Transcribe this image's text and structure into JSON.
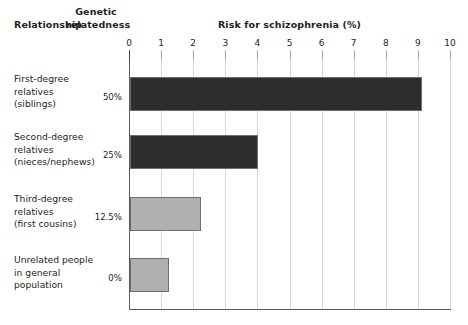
{
  "header": {
    "relationship": "Relationship",
    "genetic_relatedness": "Genetic relatedness",
    "genetic_line1": "Genetic",
    "genetic_line2": "relatedness",
    "risk_title": "Risk for schizophrenia (%)"
  },
  "colors": {
    "bar_dark": "#2d2d2d",
    "bar_light": "#b0b0b0",
    "bar_border": "#6d6e71",
    "gridline": "#d9d9d9",
    "axis": "#58595b",
    "text": "#231f20",
    "background": "#ffffff"
  },
  "chart_data": {
    "type": "bar",
    "orientation": "horizontal",
    "title": "Risk for schizophrenia (%)",
    "xlabel": "Risk for schizophrenia (%)",
    "ylabel": "Relationship",
    "xlim": [
      0,
      10
    ],
    "xticks": [
      0,
      1,
      2,
      3,
      4,
      5,
      6,
      7,
      8,
      9,
      10
    ],
    "xtick_labels": [
      "0",
      "1",
      "2",
      "3",
      "4",
      "5",
      "6",
      "7",
      "8",
      "9",
      "10"
    ],
    "grid": true,
    "legend": false,
    "categories": [
      "First-degree relatives (siblings)",
      "Second-degree relatives (nieces/nephews)",
      "Third-degree relatives (first cousins)",
      "Unrelated people in general population"
    ],
    "values": [
      9.1,
      4.0,
      2.2,
      1.2
    ],
    "genetic_relatedness": [
      "50%",
      "25%",
      "12.5%",
      "0%"
    ]
  },
  "rows": [
    {
      "label_lines": [
        "First-degree",
        "relatives",
        "(siblings)"
      ],
      "label_text": "First-degree relatives (siblings)",
      "relatedness": "50%",
      "value": 9.1,
      "color": "#2d2d2d"
    },
    {
      "label_lines": [
        "Second-degree",
        "relatives",
        "(nieces/nephews)"
      ],
      "label_text": "Second-degree relatives (nieces/nephews)",
      "relatedness": "25%",
      "value": 4.0,
      "color": "#2d2d2d"
    },
    {
      "label_lines": [
        "Third-degree",
        "relatives",
        "(first cousins)"
      ],
      "label_text": "Third-degree relatives (first cousins)",
      "relatedness": "12.5%",
      "value": 2.2,
      "color": "#b0b0b0"
    },
    {
      "label_lines": [
        "Unrelated people",
        "in general",
        "population"
      ],
      "label_text": "Unrelated people in general population",
      "relatedness": "0%",
      "value": 1.2,
      "color": "#b0b0b0"
    }
  ]
}
